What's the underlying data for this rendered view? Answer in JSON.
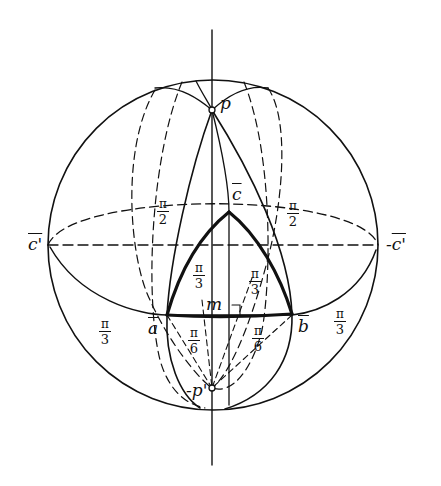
{
  "figure": {
    "colors": {
      "stroke": "#111111",
      "background": "#ffffff"
    }
  },
  "points": {
    "p": "p",
    "neg_p": "-p'",
    "c": "c",
    "a": "a",
    "b": "b",
    "m": "m",
    "c_prime_left": "c'",
    "c_prime_right": "-c'",
    "c_prime_right_prefix": "-"
  },
  "angles": {
    "left_upper": {
      "num": "π",
      "den": "2"
    },
    "right_upper": {
      "num": "π",
      "den": "2"
    },
    "inner_left": {
      "num": "π",
      "den": "3"
    },
    "inner_right": {
      "num": "π",
      "den": "3"
    },
    "outer_left": {
      "num": "π",
      "den": "3"
    },
    "outer_right": {
      "num": "π",
      "den": "3"
    },
    "lower_left": {
      "num": "π",
      "den": "6"
    },
    "lower_right": {
      "num": "π",
      "den": "6"
    }
  }
}
